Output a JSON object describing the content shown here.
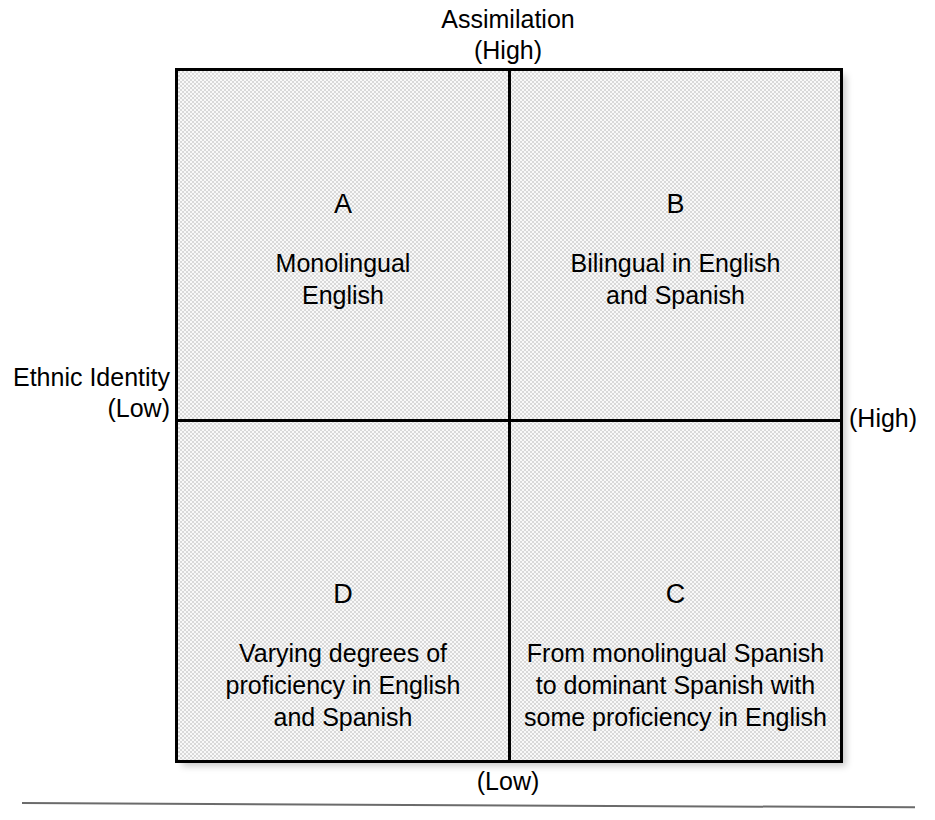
{
  "figure": {
    "axes": {
      "top": {
        "name": "Assimilation",
        "level": "(High)"
      },
      "left": {
        "name": "Ethnic Identity",
        "level": "(Low)"
      },
      "right": {
        "level": "(High)"
      },
      "bottom": {
        "level": "(Low)"
      }
    },
    "quadrants": [
      {
        "id": "A",
        "position": "top-left",
        "letter": "A",
        "lines": [
          "Monolingual",
          "English"
        ]
      },
      {
        "id": "B",
        "position": "top-right",
        "letter": "B",
        "lines": [
          "Bilingual in English",
          "and Spanish"
        ]
      },
      {
        "id": "D",
        "position": "bottom-left",
        "letter": "D",
        "lines": [
          "Varying degrees of",
          "proficiency in English",
          "and Spanish"
        ]
      },
      {
        "id": "C",
        "position": "bottom-right",
        "letter": "C",
        "lines": [
          "From monolingual Spanish",
          "to dominant Spanish with",
          "some proficiency in English"
        ]
      }
    ],
    "colors": {
      "fill": "#d9d9d9",
      "border": "#000000",
      "text": "#000000",
      "rule": "#6b6b6b"
    }
  }
}
